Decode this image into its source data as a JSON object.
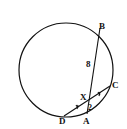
{
  "diagram": {
    "type": "circle-geometry",
    "points": {
      "B": {
        "label": "B"
      },
      "C": {
        "label": "C"
      },
      "D": {
        "label": "D"
      },
      "A": {
        "label": "A"
      },
      "X": {
        "label": "X"
      }
    },
    "segments": [
      {
        "from": "B",
        "to": "A",
        "label": "8",
        "label_part": "BX"
      },
      {
        "from": "D",
        "to": "C",
        "tick_marks": "DX = XC"
      }
    ],
    "labels": {
      "bx_length": "8",
      "xa_length": "2"
    },
    "colors": {
      "stroke": "#111111",
      "background": "#ffffff"
    }
  }
}
